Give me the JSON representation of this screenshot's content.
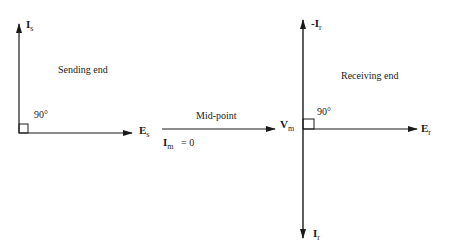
{
  "diagram": {
    "sending": {
      "title": "Sending end",
      "current_label": "I",
      "current_sub": "s",
      "voltage_label": "E",
      "voltage_sub": "s",
      "angle": "90°"
    },
    "midpoint": {
      "title": "Mid-point",
      "current_label": "I",
      "current_sub": "m",
      "current_value": "= 0",
      "voltage_label": "V",
      "voltage_sub": "m"
    },
    "receiving": {
      "title": "Receiving end",
      "neg_current_label": "-I",
      "neg_current_sub": "r",
      "current_label": "I",
      "current_sub": "r",
      "voltage_label": "E",
      "voltage_sub": "r",
      "angle": "90°"
    },
    "colors": {
      "line": "#1a1a1a",
      "background": "#ffffff"
    }
  }
}
